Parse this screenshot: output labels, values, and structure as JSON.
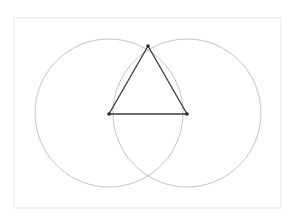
{
  "figure": {
    "canvas": {
      "width": 294,
      "height": 219,
      "background_color": "#ffffff"
    },
    "frame": {
      "name": "page border",
      "x": 14,
      "y": 18,
      "width": 267,
      "height": 190,
      "stroke_color": "#e8e8e8",
      "stroke_width": 1.2,
      "fill_color": "#ffffff"
    },
    "circles": [
      {
        "label": "left circle",
        "cx": 109,
        "cy": 113,
        "r": 74,
        "stroke_color": "#b2b2b2",
        "stroke_width": 0.8
      },
      {
        "label": "right circle",
        "cx": 187,
        "cy": 113,
        "r": 74,
        "stroke_color": "#b2b2b2",
        "stroke_width": 0.8
      }
    ],
    "triangle": {
      "label": "equilateral triangle",
      "stroke_color": "#3a3a3a",
      "stroke_width": 1.3,
      "vertices": [
        {
          "label": "apex",
          "x": 148,
          "y": 46
        },
        {
          "label": "base-left",
          "x": 109,
          "y": 114
        },
        {
          "label": "base-right",
          "x": 187,
          "y": 114
        }
      ],
      "edges": [
        {
          "label": "left side",
          "x1": 109,
          "y1": 114,
          "x2": 148,
          "y2": 46
        },
        {
          "label": "right side",
          "x1": 148,
          "y1": 46,
          "x2": 187,
          "y2": 114
        },
        {
          "label": "base",
          "x1": 109,
          "y1": 114,
          "x2": 187,
          "y2": 114
        }
      ],
      "vertex_dot": {
        "radius": 1.8,
        "color": "#2b2b2b"
      }
    },
    "intersections": [
      {
        "label": "upper intersection",
        "x": 148,
        "y": 46
      },
      {
        "label": "lower intersection",
        "x": 148,
        "y": 181
      }
    ]
  }
}
